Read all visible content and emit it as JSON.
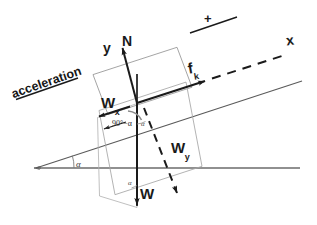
{
  "diagram": {
    "incline_angle_symbol": "α",
    "colors": {
      "ink": "#1a1a1a",
      "ground_line": "#6b6b6b",
      "incline_line": "#5a5a5a",
      "construction": "#9a9a9a",
      "arc": "#8a8a8a"
    }
  },
  "labels": {
    "acceleration": "acceleration",
    "plus_sign": "+",
    "axis_x": "x",
    "axis_y": "y",
    "normal_force": "N",
    "friction_force_base": "f",
    "friction_force_sub": "k",
    "weight": "W",
    "weight_x_base": "W",
    "weight_x_sub": "x",
    "weight_y_base": "W",
    "weight_y_sub": "y",
    "angle_incline_base": "α",
    "angle_incline_origin": "α",
    "angle_incline_bottom": "α",
    "angle_complement": "90°−α"
  },
  "geometry": {
    "origin": {
      "x": 137,
      "y": 103
    },
    "incline_angle_deg": 18,
    "ground_line": {
      "x1": 35,
      "y1": 168,
      "x2": 300,
      "y2": 168
    },
    "incline_line": {
      "x1": 35,
      "y1": 168,
      "x2": 300,
      "y2": 82
    }
  }
}
